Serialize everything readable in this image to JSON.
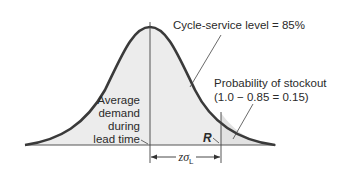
{
  "labels": {
    "cycle_service": "Cycle-service level = 85%",
    "stockout_line1": "Probability of stockout",
    "stockout_line2": "(1.0 − 0.85 = 0.15)",
    "average_line1": "Average",
    "average_line2": "demand",
    "average_line3": "during",
    "average_line4": "lead time",
    "reorder_point": "R",
    "safety_stock_z": "z",
    "safety_stock_sigma": "σ",
    "safety_stock_sub": "L"
  },
  "values": {
    "cycle_service_level_pct": 85,
    "stockout_probability": 0.15
  },
  "colors": {
    "curve": "#3a3a3a",
    "fill": "#e8e8e8",
    "line": "#444444",
    "text": "#2a2a2a"
  }
}
